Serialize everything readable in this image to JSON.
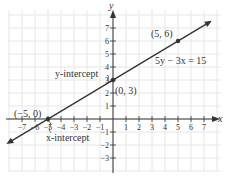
{
  "chart_data": {
    "type": "line",
    "title": "",
    "xlabel": "x",
    "ylabel": "y",
    "xlim": [
      -7.8,
      8
    ],
    "ylim": [
      -4,
      8.3
    ],
    "grid": true,
    "x_ticks": [
      -7,
      -6,
      -5,
      -4,
      -3,
      -2,
      -1,
      1,
      2,
      3,
      4,
      5,
      6,
      7
    ],
    "x_tick_labels": [
      "−7",
      "−6",
      "−5",
      "−4",
      "−3",
      "−2",
      "−1",
      "1",
      "2",
      "3",
      "4",
      "5",
      "6",
      "7"
    ],
    "y_ticks": [
      -3,
      -2,
      -1,
      1,
      2,
      3,
      4,
      5,
      6,
      7
    ],
    "y_tick_labels": [
      "−3",
      "−2",
      "−1",
      "1",
      "2",
      "3",
      "4",
      "5",
      "6",
      "7"
    ],
    "series": [
      {
        "name": "5y − 3x = 15",
        "equation": "5y - 3x = 15",
        "slope": 0.6,
        "intercept": 3,
        "x": [
          -8.2,
          7.6
        ],
        "y": [
          -1.92,
          7.56
        ],
        "color": "#333333",
        "arrows_both_ends": true
      }
    ],
    "points": [
      {
        "x": -5,
        "y": 0,
        "label": "(−5, 0)"
      },
      {
        "x": 0,
        "y": 3,
        "label": "(0, 3)"
      },
      {
        "x": 5,
        "y": 6,
        "label": "(5, 6)"
      }
    ],
    "annotations": [
      {
        "text": "y-intercept",
        "points_to": [
          0,
          3
        ]
      },
      {
        "text": "x-intercept",
        "points_to": [
          -5,
          0
        ]
      },
      {
        "text": "5y − 3x = 15",
        "near": [
          5.2,
          5
        ]
      }
    ]
  },
  "labels": {
    "x_axis": "x",
    "y_axis": "y",
    "point_neg5_0": "(−5, 0)",
    "point_0_3": "(0, 3)",
    "point_5_6": "(5, 6)",
    "equation": "5y − 3x = 15",
    "y_intercept": "y-intercept",
    "x_intercept": "x-intercept"
  },
  "colors": {
    "grid": "#e6e6e6",
    "axis": "#333333",
    "line": "#333333",
    "text": "#333333"
  }
}
